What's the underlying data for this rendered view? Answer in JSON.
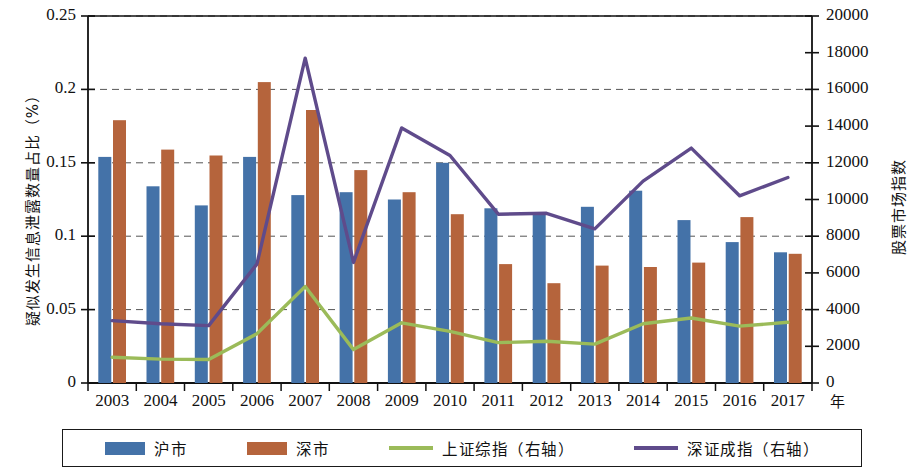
{
  "chart_data": {
    "type": "bar",
    "title": "",
    "xlabel": "年",
    "ylabel": "疑似发生信息泄露数量占比（%）",
    "y2label": "股票市场指数",
    "categories": [
      "2003",
      "2004",
      "2005",
      "2006",
      "2007",
      "2008",
      "2009",
      "2010",
      "2011",
      "2012",
      "2013",
      "2014",
      "2015",
      "2016",
      "2017"
    ],
    "ylim": [
      0,
      0.25
    ],
    "yticks": [
      "0",
      "0.05",
      "0.1",
      "0.15",
      "0.2",
      "0.25"
    ],
    "ytick_values": [
      0,
      0.05,
      0.1,
      0.15,
      0.2,
      0.25
    ],
    "y2lim": [
      0,
      20000
    ],
    "y2ticks": [
      "0",
      "2000",
      "4000",
      "6000",
      "8000",
      "10000",
      "12000",
      "14000",
      "16000",
      "18000",
      "20000"
    ],
    "y2tick_values": [
      0,
      2000,
      4000,
      6000,
      8000,
      10000,
      12000,
      14000,
      16000,
      18000,
      20000
    ],
    "grid": true,
    "legend_position": "bottom",
    "series": [
      {
        "name": "沪市",
        "type": "bar",
        "axis": "left",
        "color": "#4472A8",
        "values": [
          0.154,
          0.134,
          0.121,
          0.154,
          0.128,
          0.13,
          0.125,
          0.15,
          0.119,
          0.115,
          0.12,
          0.131,
          0.111,
          0.096,
          0.089
        ]
      },
      {
        "name": "深市",
        "type": "bar",
        "axis": "left",
        "color": "#B5643C",
        "values": [
          0.179,
          0.159,
          0.155,
          0.205,
          0.186,
          0.145,
          0.13,
          0.115,
          0.081,
          0.068,
          0.08,
          0.079,
          0.082,
          0.113,
          0.088
        ]
      },
      {
        "name": "上证综指（右轴）",
        "type": "line",
        "axis": "right",
        "color": "#9BBB59",
        "values": [
          1400,
          1300,
          1280,
          2680,
          5260,
          1820,
          3280,
          2810,
          2200,
          2270,
          2120,
          3230,
          3540,
          3100,
          3310
        ]
      },
      {
        "name": "深证成指（右轴）",
        "type": "line",
        "axis": "right",
        "color": "#5F4B8B",
        "values": [
          3400,
          3230,
          3130,
          6480,
          17700,
          6570,
          13900,
          12400,
          9200,
          9250,
          8400,
          11000,
          12800,
          10200,
          11200
        ]
      }
    ]
  }
}
